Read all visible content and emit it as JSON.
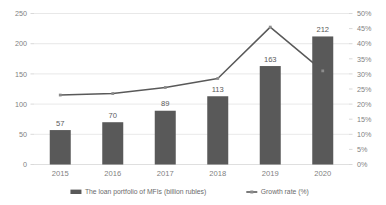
{
  "chart_data": {
    "type": "bar",
    "title": "",
    "xlabel": "",
    "ylabel": "",
    "categories": [
      "2015",
      "2016",
      "2017",
      "2018",
      "2019",
      "2020"
    ],
    "series": [
      {
        "name": "The loan portfolio of MFIs (billion rubles)",
        "type": "bar",
        "axis": "left",
        "values": [
          57,
          70,
          89,
          113,
          163,
          212
        ],
        "labels": [
          "57",
          "70",
          "89",
          "113",
          "163",
          "212"
        ],
        "color": "#595959"
      },
      {
        "name": "Growth rate (%)",
        "type": "line",
        "axis": "right",
        "values": [
          23,
          23.5,
          25.5,
          28.5,
          45.5,
          31
        ],
        "color": "#595959"
      }
    ],
    "left_axis": {
      "ticks": [
        "0",
        "50",
        "100",
        "150",
        "200",
        "250"
      ],
      "values": [
        0,
        50,
        100,
        150,
        200,
        250
      ],
      "ylim": [
        0,
        250
      ]
    },
    "right_axis": {
      "ticks": [
        "0%",
        "5%",
        "10%",
        "15%",
        "20%",
        "25%",
        "30%",
        "35%",
        "40%",
        "45%",
        "50%"
      ],
      "values": [
        0,
        5,
        10,
        15,
        20,
        25,
        30,
        35,
        40,
        45,
        50
      ],
      "ylim": [
        0,
        50
      ]
    },
    "grid": true,
    "legend_position": "bottom",
    "legend": [
      {
        "label": "The loan portfolio of MFIs (billion rubles)",
        "marker": "bar-swatch",
        "color": "#595959"
      },
      {
        "label": "Growth rate (%)",
        "marker": "line-swatch",
        "color": "#595959"
      }
    ],
    "colors": {
      "bar": "#595959",
      "line": "#595959",
      "grid": "#d9d9d9",
      "text": "#7f7f7f",
      "background": "#ffffff"
    }
  }
}
